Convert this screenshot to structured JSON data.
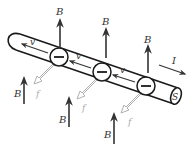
{
  "diagram": {
    "colors": {
      "line": "#1a1a1a",
      "arrow": "#333333",
      "force_arrow": "#b0b0b0",
      "background": "#ffffff"
    },
    "labels": {
      "magnetic_field": "B",
      "velocity": "v",
      "force": "f",
      "current": "I",
      "cross_section": "S",
      "electron_charge": "−"
    },
    "b_arrows_top": [
      {
        "x": 60,
        "y1": 47,
        "y2": 18,
        "label": "B"
      },
      {
        "x": 106,
        "y1": 57,
        "y2": 27,
        "label": "B"
      },
      {
        "x": 148,
        "y1": 71,
        "y2": 44,
        "label": "B"
      }
    ],
    "b_arrows_bottom": [
      {
        "x": 24,
        "y1": 104,
        "y2": 76,
        "label": "B"
      },
      {
        "x": 69,
        "y1": 127,
        "y2": 96,
        "label": "B"
      },
      {
        "x": 115,
        "y1": 144,
        "y2": 112,
        "label": "B"
      }
    ],
    "electrons": [
      {
        "cx": 59,
        "cy": 57,
        "label": "−"
      },
      {
        "cx": 102,
        "cy": 72,
        "label": "−"
      },
      {
        "cx": 146,
        "cy": 86,
        "label": "−"
      }
    ],
    "velocity_labels": [
      "v",
      "v",
      "v"
    ],
    "force_labels": [
      "f",
      "f",
      "f"
    ]
  }
}
